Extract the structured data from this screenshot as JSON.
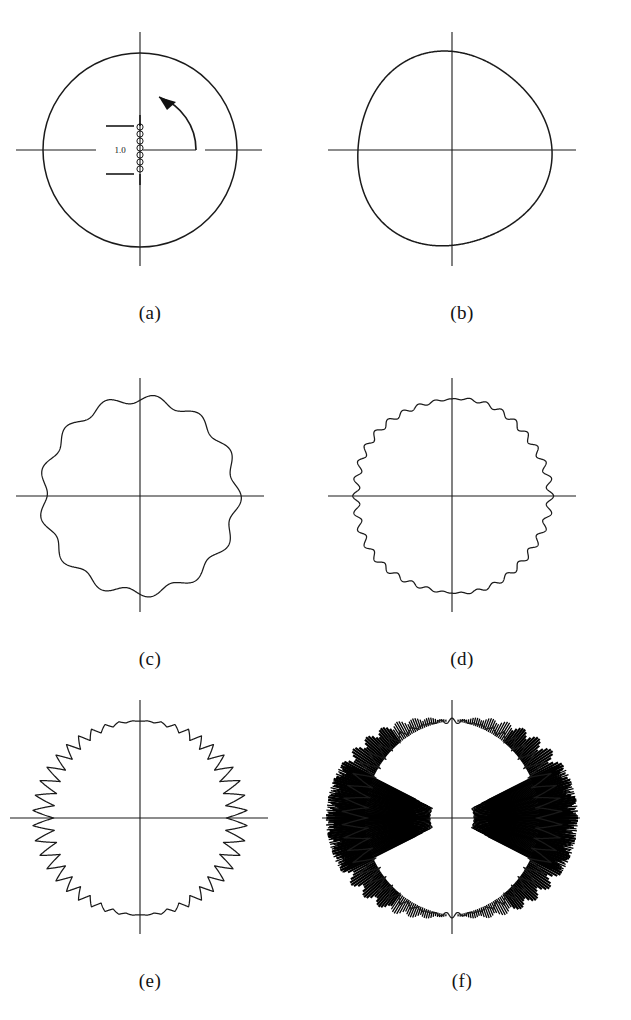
{
  "figure": {
    "background_color": "#ffffff",
    "ink_color": "#1a1a1a",
    "panel_count": 6,
    "layout": "2 columns x 3 rows"
  },
  "annotations": {
    "scale_label": "1.0",
    "scale_name": "scale-bar",
    "bead_count": 6,
    "arrow_direction": "counterclockwise",
    "arrow_start_angle_deg": 0,
    "arrow_end_angle_deg": 135
  },
  "panels": [
    {
      "id": "a",
      "caption": "(a)",
      "harmonic_n": 0,
      "amplitude": 0.0,
      "description": "unperturbed circle with 1.0 scale bar, bead column and counterclockwise angle arrow"
    },
    {
      "id": "b",
      "caption": "(b)",
      "harmonic_n": 3,
      "amplitude": 0.035,
      "description": "circle with very gentle low-order lobing"
    },
    {
      "id": "c",
      "caption": "(c)",
      "harmonic_n": 13,
      "amplitude": 0.045,
      "description": "circle with smooth medium-frequency ripples"
    },
    {
      "id": "d",
      "caption": "(d)",
      "harmonic_n": 36,
      "amplitude": 0.035,
      "description": "circle with fine dense ripples, larger near the horizontal axis"
    },
    {
      "id": "e",
      "caption": "(e)",
      "harmonic_n": 44,
      "amplitude": 0.11,
      "description": "sawtooth spikes peaking at the left and right horizontal axes"
    },
    {
      "id": "f",
      "caption": "(f)",
      "harmonic_n": 52,
      "amplitude": 0.3,
      "description": "dense long radial spikes forming solid black wedges near the horizontal axes"
    }
  ],
  "chart_data": {
    "type": "line",
    "plot_kind": "polar",
    "xlabel": "",
    "ylabel": "",
    "grid": false,
    "legend": null,
    "axes": {
      "radial_unit": "1.0",
      "base_radius": 1.0,
      "theta_range_deg": [
        0,
        360
      ],
      "crosshair_axes": [
        "horizontal",
        "vertical"
      ]
    },
    "series": [
      {
        "name": "(a)",
        "panel": "a",
        "model": "r(theta) = 1.0",
        "harmonic_n": 0,
        "amplitude": 0.0,
        "envelope": "none",
        "values": [
          1.0,
          1.0,
          1.0,
          1.0,
          1.0,
          1.0,
          1.0,
          1.0,
          1.0,
          1.0,
          1.0,
          1.0
        ]
      },
      {
        "name": "(b)",
        "panel": "b",
        "model": "r(theta) = 1.0 + 0.035*cos(3*theta)",
        "harmonic_n": 3,
        "amplitude": 0.035,
        "envelope": "none",
        "values": [
          1.035,
          1.0,
          0.965,
          1.0,
          1.035,
          1.0,
          0.965,
          1.0,
          1.035,
          1.0,
          0.965,
          1.0
        ]
      },
      {
        "name": "(c)",
        "panel": "c",
        "model": "r(theta) = 1.0 + 0.045*cos(13*theta)",
        "harmonic_n": 13,
        "amplitude": 0.045,
        "envelope": "none",
        "values": [
          1.045,
          0.97,
          1.02,
          1.01,
          0.96,
          1.04,
          1.0,
          0.955,
          1.045,
          0.98,
          1.01,
          1.02
        ]
      },
      {
        "name": "(d)",
        "panel": "d",
        "model": "r(theta) = 1.0 + 0.035*|cos(theta)|^0.6 * cos(36*theta)",
        "harmonic_n": 36,
        "amplitude": 0.035,
        "envelope": "|cos(theta)|",
        "values": [
          1.035,
          1.02,
          1.0,
          0.985,
          1.0,
          1.02,
          1.035,
          1.02,
          1.0,
          0.985,
          1.0,
          1.02
        ]
      },
      {
        "name": "(e)",
        "panel": "e",
        "model": "r(theta) = 1.0 + 0.11*|cos(theta)|^1.2 * sawtooth(44*theta)",
        "harmonic_n": 44,
        "amplitude": 0.11,
        "envelope": "|cos(theta)|",
        "values": [
          1.11,
          1.07,
          1.02,
          1.0,
          1.02,
          1.07,
          1.11,
          1.07,
          1.02,
          1.0,
          1.02,
          1.07
        ]
      },
      {
        "name": "(f)",
        "panel": "f",
        "model": "r(theta) = 1.0 + 0.30*|cos(theta)|^1.1 * spikes(52*theta)",
        "harmonic_n": 52,
        "amplitude": 0.3,
        "envelope": "|cos(theta)|",
        "values": [
          1.3,
          1.22,
          1.1,
          1.0,
          1.1,
          1.22,
          1.3,
          1.22,
          1.1,
          1.0,
          1.1,
          1.22
        ]
      }
    ]
  }
}
